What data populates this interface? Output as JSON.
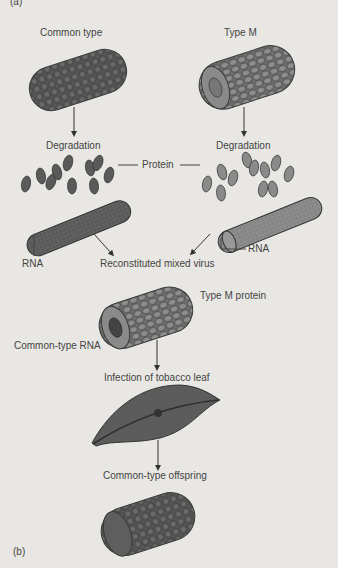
{
  "panel_labels": {
    "a": "(a)",
    "b": "(b)"
  },
  "labels": {
    "common_type": "Common type",
    "type_m": "Type M",
    "degradation_left": "Degradation",
    "degradation_right": "Degradation",
    "protein": "Protein",
    "rna_left": "RNA",
    "rna_right": "RNA",
    "reconstituted": "Reconstituted mixed virus",
    "type_m_protein": "Type M protein",
    "common_type_rna": "Common-type RNA",
    "infection": "Infection of tobacco leaf",
    "offspring": "Common-type offspring"
  },
  "colors": {
    "background": "#e9e7e3",
    "dark_virus": "#5a5a5a",
    "light_virus": "#8a8a8a",
    "text": "#444444"
  }
}
